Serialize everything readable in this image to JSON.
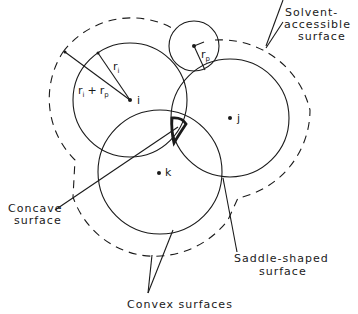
{
  "diagram": {
    "type": "molecular-surface-schematic",
    "atoms": [
      {
        "id": "i",
        "label": "i"
      },
      {
        "id": "j",
        "label": "j"
      },
      {
        "id": "k",
        "label": "k"
      }
    ],
    "probe": {
      "label_main": "r",
      "label_sub": "p"
    },
    "radius_labels": {
      "ri_main": "r",
      "ri_sub": "i",
      "rirp_main1": "r",
      "rirp_sub1": "i",
      "rirp_plus": "+",
      "rirp_main2": "r",
      "rirp_sub2": "p"
    },
    "labels": {
      "solvent_line1": "Solvent-",
      "solvent_line2": "accessible",
      "solvent_line3": "surface",
      "concave_line1": "Concave",
      "concave_line2": "surface",
      "saddle_line1": "Saddle-shaped",
      "saddle_line2": "surface",
      "convex": "Convex  surfaces"
    },
    "colors": {
      "stroke": "#1a1a1a",
      "background": "#ffffff"
    }
  }
}
